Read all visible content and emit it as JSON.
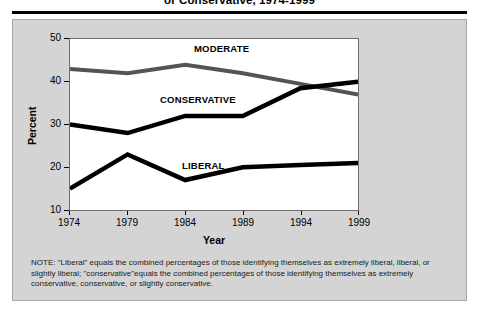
{
  "figure": {
    "title": "or Conservative, 1974-1999",
    "note": "NOTE:  \"Liberal\" equals the combined percentages of those identifying themselves as extremely liberal, liberal, or slightly liberal; \"conservative\"equals the combined percentages of those identifying themselves as extremely conservative, conservative, or slightly conservative."
  },
  "chart_data": {
    "type": "line",
    "title": "or Conservative, 1974-1999",
    "xlabel": "Year",
    "ylabel": "Percent",
    "x": [
      1974,
      1979,
      1984,
      1989,
      1994,
      1999
    ],
    "xticklabels": [
      "1974",
      "1979",
      "1984",
      "1989",
      "1994",
      "1999"
    ],
    "yticklabels": [
      "10",
      "20",
      "30",
      "40",
      "50"
    ],
    "ylim": [
      10,
      50
    ],
    "xlim": [
      1974,
      1999
    ],
    "grid": false,
    "legend": "inline-labels",
    "series": [
      {
        "name": "MODERATE",
        "color": "#545454",
        "values": [
          43,
          42,
          44,
          42,
          39.5,
          37
        ]
      },
      {
        "name": "CONSERVATIVE",
        "color": "#000000",
        "values": [
          30,
          28,
          32,
          32,
          38.5,
          40
        ]
      },
      {
        "name": "LIBERAL",
        "color": "#000000",
        "values": [
          15,
          23,
          17,
          20,
          20.5,
          21
        ]
      }
    ]
  },
  "colors": {
    "panel": "#d4d4d4",
    "plot_background": "#ffffff",
    "moderate": "#545454",
    "conservative": "#000000",
    "liberal": "#000000",
    "axis": "#000000"
  },
  "ticks": {
    "y": [
      {
        "label": "50",
        "top": 33
      },
      {
        "label": "40",
        "top": 76
      },
      {
        "label": "30",
        "top": 119
      },
      {
        "label": "20",
        "top": 162
      },
      {
        "label": "10",
        "top": 205
      }
    ],
    "x": [
      {
        "label": "1974",
        "left": 49
      },
      {
        "label": "1979",
        "left": 107
      },
      {
        "label": "1984",
        "left": 165
      },
      {
        "label": "1989",
        "left": 223
      },
      {
        "label": "1994",
        "left": 281
      },
      {
        "label": "1999",
        "left": 339
      }
    ]
  },
  "series_labels": [
    {
      "name": "MODERATE",
      "left": 194,
      "top": 43
    },
    {
      "name": "CONSERVATIVE",
      "left": 160,
      "top": 94
    },
    {
      "name": "LIBERAL",
      "left": 182,
      "top": 160
    }
  ]
}
